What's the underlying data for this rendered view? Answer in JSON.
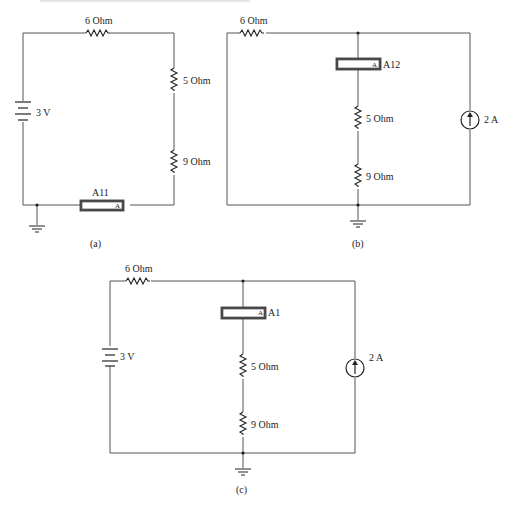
{
  "panels": {
    "a": {
      "caption": "(a)",
      "resistor_top": "6 Ohm",
      "resistor_right_upper": "5 Ohm",
      "resistor_right_lower": "9 Ohm",
      "battery": "3 V",
      "ammeter_name": "A11",
      "ammeter_letter": "A"
    },
    "b": {
      "caption": "(b)",
      "resistor_top": "6 Ohm",
      "resistor_mid_upper": "5 Ohm",
      "resistor_mid_lower": "9 Ohm",
      "current_source": "2 A",
      "ammeter_name": "A12",
      "ammeter_letter": "A"
    },
    "c": {
      "caption": "(c)",
      "resistor_top": "6 Ohm",
      "resistor_mid_upper": "5 Ohm",
      "resistor_mid_lower": "9 Ohm",
      "battery": "3 V",
      "current_source": "2 A",
      "ammeter_name": "A1",
      "ammeter_letter": "A"
    }
  }
}
